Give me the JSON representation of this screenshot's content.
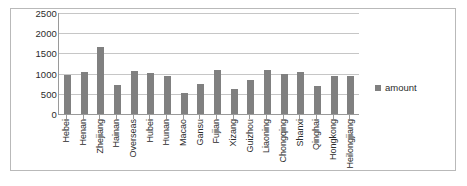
{
  "chart_data": {
    "type": "bar",
    "title": "",
    "xlabel": "",
    "ylabel": "",
    "ylim": [
      0,
      2500
    ],
    "yticks": [
      2500,
      2000,
      1500,
      1000,
      500,
      0
    ],
    "grid": true,
    "legend_position": "right",
    "series_name": "amount",
    "series_color": "#808080",
    "categories": [
      "Hebei",
      "Henan",
      "Zhejiang",
      "Hainan",
      "Overseas",
      "Hubei",
      "Hunan",
      "Macao",
      "Gansu",
      "Fujian",
      "Xizang",
      "Guizhou",
      "Liaoning",
      "Chongqing",
      "Shanxi",
      "Qinghai",
      "Hongkong",
      "Heilongjiang"
    ],
    "values": [
      960,
      1040,
      1660,
      720,
      1070,
      1010,
      950,
      520,
      750,
      1100,
      620,
      840,
      1080,
      980,
      1050,
      700,
      950,
      950
    ],
    "series": [
      {
        "name": "amount",
        "values": [
          960,
          1040,
          1660,
          720,
          1070,
          1010,
          950,
          520,
          750,
          1100,
          620,
          840,
          1080,
          980,
          1050,
          700,
          950,
          950
        ]
      }
    ]
  },
  "legend": {
    "label": "amount"
  }
}
